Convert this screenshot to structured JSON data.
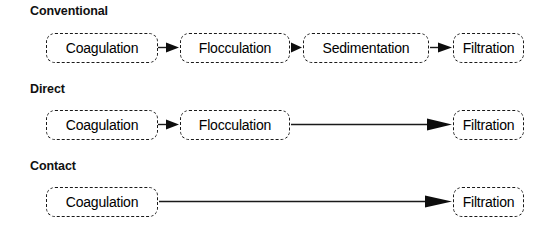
{
  "diagram": {
    "title_type": "water-treatment-process-flow",
    "background_color": "#ffffff",
    "line_color": "#1a1a1a",
    "node_border_style": "dashed",
    "rows": [
      {
        "title": "Conventional",
        "nodes": [
          {
            "label": "Coagulation",
            "x": 46,
            "width": 112
          },
          {
            "label": "Flocculation",
            "x": 180,
            "width": 110
          },
          {
            "label": "Sedimentation",
            "x": 303,
            "width": 126
          },
          {
            "label": "Filtration",
            "x": 453,
            "width": 71
          }
        ],
        "arrows": [
          {
            "x1": 158,
            "x2": 179
          },
          {
            "x1": 291,
            "x2": 302
          },
          {
            "x1": 430,
            "x2": 452
          }
        ]
      },
      {
        "title": "Direct",
        "nodes": [
          {
            "label": "Coagulation",
            "x": 46,
            "width": 112
          },
          {
            "label": "Flocculation",
            "x": 180,
            "width": 110
          },
          {
            "label": "Filtration",
            "x": 453,
            "width": 71
          }
        ],
        "arrows": [
          {
            "x1": 158,
            "x2": 179
          },
          {
            "x1": 291,
            "x2": 452
          }
        ]
      },
      {
        "title": "Contact",
        "nodes": [
          {
            "label": "Coagulation",
            "x": 46,
            "width": 112
          },
          {
            "label": "Filtration",
            "x": 453,
            "width": 71
          }
        ],
        "arrows": [
          {
            "x1": 159,
            "x2": 452
          }
        ]
      }
    ]
  }
}
